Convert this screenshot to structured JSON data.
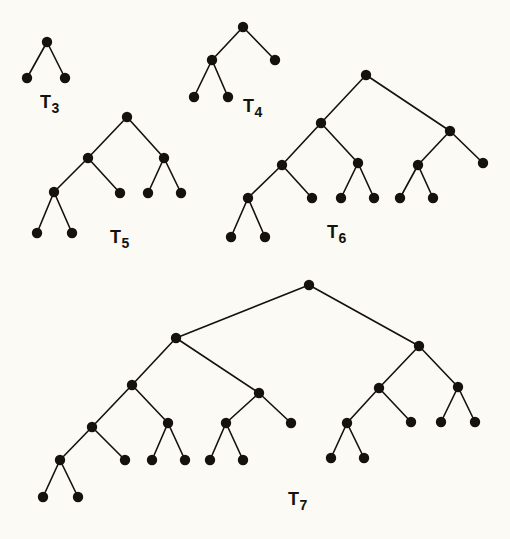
{
  "figure": {
    "background_color": "#fbfaf4",
    "ink_color": "#14110e",
    "node_radius": 5.2,
    "width": 510,
    "height": 539
  },
  "trees": [
    {
      "id": "T3",
      "label_main": "T",
      "label_sub": "3",
      "label_x": 40,
      "label_y": 108,
      "node_count": 3,
      "nodes": [
        {
          "id": "n0",
          "x": 47,
          "y": 42
        },
        {
          "id": "n1",
          "x": 27,
          "y": 78
        },
        {
          "id": "n2",
          "x": 65,
          "y": 78
        }
      ],
      "edges": [
        [
          "n0",
          "n1"
        ],
        [
          "n0",
          "n2"
        ]
      ]
    },
    {
      "id": "T4",
      "label_main": "T",
      "label_sub": "4",
      "label_x": 243,
      "label_y": 112,
      "node_count": 5,
      "nodes": [
        {
          "id": "n0",
          "x": 243,
          "y": 27
        },
        {
          "id": "n1",
          "x": 212,
          "y": 60
        },
        {
          "id": "n2",
          "x": 275,
          "y": 60
        },
        {
          "id": "n3",
          "x": 194,
          "y": 97
        },
        {
          "id": "n4",
          "x": 228,
          "y": 97
        }
      ],
      "edges": [
        [
          "n0",
          "n1"
        ],
        [
          "n0",
          "n2"
        ],
        [
          "n1",
          "n3"
        ],
        [
          "n1",
          "n4"
        ]
      ]
    },
    {
      "id": "T5",
      "label_main": "T",
      "label_sub": "5",
      "label_x": 110,
      "label_y": 243,
      "node_count": 9,
      "nodes": [
        {
          "id": "n0",
          "x": 127,
          "y": 117
        },
        {
          "id": "n1",
          "x": 88,
          "y": 158
        },
        {
          "id": "n2",
          "x": 164,
          "y": 158
        },
        {
          "id": "n3",
          "x": 54,
          "y": 192
        },
        {
          "id": "n4",
          "x": 120,
          "y": 193
        },
        {
          "id": "n5",
          "x": 148,
          "y": 193
        },
        {
          "id": "n6",
          "x": 181,
          "y": 193
        },
        {
          "id": "n7",
          "x": 37,
          "y": 233
        },
        {
          "id": "n8",
          "x": 72,
          "y": 233
        }
      ],
      "edges": [
        [
          "n0",
          "n1"
        ],
        [
          "n0",
          "n2"
        ],
        [
          "n1",
          "n3"
        ],
        [
          "n1",
          "n4"
        ],
        [
          "n2",
          "n5"
        ],
        [
          "n2",
          "n6"
        ],
        [
          "n3",
          "n7"
        ],
        [
          "n3",
          "n8"
        ]
      ]
    },
    {
      "id": "T6",
      "label_main": "T",
      "label_sub": "6",
      "label_x": 327,
      "label_y": 238,
      "node_count": 15,
      "nodes": [
        {
          "id": "n0",
          "x": 366,
          "y": 75
        },
        {
          "id": "n1",
          "x": 321,
          "y": 123
        },
        {
          "id": "n2",
          "x": 450,
          "y": 131
        },
        {
          "id": "n3",
          "x": 282,
          "y": 165
        },
        {
          "id": "n4",
          "x": 358,
          "y": 163
        },
        {
          "id": "n5",
          "x": 418,
          "y": 165
        },
        {
          "id": "n6",
          "x": 483,
          "y": 163
        },
        {
          "id": "n7",
          "x": 248,
          "y": 198
        },
        {
          "id": "n8",
          "x": 312,
          "y": 198
        },
        {
          "id": "n9",
          "x": 341,
          "y": 198
        },
        {
          "id": "n10",
          "x": 374,
          "y": 198
        },
        {
          "id": "n11",
          "x": 400,
          "y": 198
        },
        {
          "id": "n12",
          "x": 433,
          "y": 198
        },
        {
          "id": "n13",
          "x": 231,
          "y": 237
        },
        {
          "id": "n14",
          "x": 265,
          "y": 237
        }
      ],
      "edges": [
        [
          "n0",
          "n1"
        ],
        [
          "n0",
          "n2"
        ],
        [
          "n1",
          "n3"
        ],
        [
          "n1",
          "n4"
        ],
        [
          "n2",
          "n5"
        ],
        [
          "n2",
          "n6"
        ],
        [
          "n3",
          "n7"
        ],
        [
          "n3",
          "n8"
        ],
        [
          "n4",
          "n9"
        ],
        [
          "n4",
          "n10"
        ],
        [
          "n5",
          "n11"
        ],
        [
          "n5",
          "n12"
        ],
        [
          "n7",
          "n13"
        ],
        [
          "n7",
          "n14"
        ]
      ]
    },
    {
      "id": "T7",
      "label_main": "T",
      "label_sub": "7",
      "label_x": 288,
      "label_y": 505,
      "node_count": 25,
      "nodes": [
        {
          "id": "n0",
          "x": 309,
          "y": 285
        },
        {
          "id": "n1",
          "x": 176,
          "y": 338
        },
        {
          "id": "n2",
          "x": 419,
          "y": 346
        },
        {
          "id": "n3",
          "x": 132,
          "y": 385
        },
        {
          "id": "n4",
          "x": 259,
          "y": 393
        },
        {
          "id": "n5",
          "x": 379,
          "y": 388
        },
        {
          "id": "n6",
          "x": 458,
          "y": 387
        },
        {
          "id": "n7",
          "x": 92,
          "y": 427
        },
        {
          "id": "n8",
          "x": 168,
          "y": 423
        },
        {
          "id": "n9",
          "x": 226,
          "y": 423
        },
        {
          "id": "n10",
          "x": 291,
          "y": 423
        },
        {
          "id": "n11",
          "x": 347,
          "y": 423
        },
        {
          "id": "n12",
          "x": 411,
          "y": 422
        },
        {
          "id": "n13",
          "x": 441,
          "y": 422
        },
        {
          "id": "n14",
          "x": 475,
          "y": 422
        },
        {
          "id": "n15",
          "x": 60,
          "y": 460
        },
        {
          "id": "n16",
          "x": 125,
          "y": 460
        },
        {
          "id": "n17",
          "x": 152,
          "y": 460
        },
        {
          "id": "n18",
          "x": 185,
          "y": 460
        },
        {
          "id": "n19",
          "x": 210,
          "y": 460
        },
        {
          "id": "n20",
          "x": 243,
          "y": 460
        },
        {
          "id": "n21",
          "x": 331,
          "y": 458
        },
        {
          "id": "n22",
          "x": 364,
          "y": 458
        },
        {
          "id": "n23",
          "x": 43,
          "y": 497
        },
        {
          "id": "n24",
          "x": 78,
          "y": 497
        }
      ],
      "edges": [
        [
          "n0",
          "n1"
        ],
        [
          "n0",
          "n2"
        ],
        [
          "n1",
          "n3"
        ],
        [
          "n1",
          "n4"
        ],
        [
          "n2",
          "n5"
        ],
        [
          "n2",
          "n6"
        ],
        [
          "n3",
          "n7"
        ],
        [
          "n3",
          "n8"
        ],
        [
          "n4",
          "n9"
        ],
        [
          "n4",
          "n10"
        ],
        [
          "n5",
          "n11"
        ],
        [
          "n5",
          "n12"
        ],
        [
          "n6",
          "n13"
        ],
        [
          "n6",
          "n14"
        ],
        [
          "n7",
          "n15"
        ],
        [
          "n7",
          "n16"
        ],
        [
          "n8",
          "n17"
        ],
        [
          "n8",
          "n18"
        ],
        [
          "n9",
          "n19"
        ],
        [
          "n9",
          "n20"
        ],
        [
          "n11",
          "n21"
        ],
        [
          "n11",
          "n22"
        ],
        [
          "n15",
          "n23"
        ],
        [
          "n15",
          "n24"
        ]
      ]
    }
  ]
}
